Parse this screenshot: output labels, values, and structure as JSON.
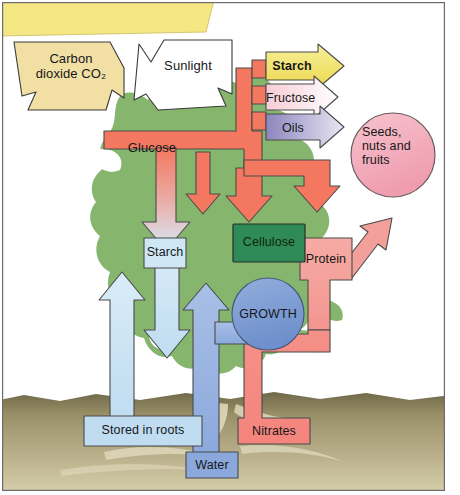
{
  "diagram": {
    "frame": {
      "border_color": "#6b6b6b"
    }
  },
  "palette": {
    "banner_yellow": "#f4e784",
    "co2_tan": "#f2dfa3",
    "sunlight_white": "#ffffff",
    "glucose_salmon": "#f4785f",
    "starch_yellow": "#f2e06a",
    "fructose_pink": "#f4b8c4",
    "oils_purple": "#9a93c4",
    "seeds_pink": "#f3aebc",
    "cellulose_green": "#2e8b57",
    "protein_salmon": "#f4a09a",
    "nitrates_salmon": "#f4847c",
    "growth_blue": "#7b9bd4",
    "water_blue": "#8aa8dc",
    "stored_blue": "#bfdcf0",
    "starch_box_blue": "#cfe6f5",
    "foliage_green": "#86b66e",
    "soil_dark": "#7d7452",
    "soil_light": "#cfc5a0",
    "outline": "#3a3a3a"
  },
  "nodes": {
    "carbon_dioxide": {
      "label": "Carbon\ndioxide CO₂",
      "shape": "down-chevron-arrow",
      "color": "#f2dfa3"
    },
    "sunlight": {
      "label": "Sunlight",
      "shape": "down-chevron-arrow",
      "color": "#ffffff"
    },
    "glucose": {
      "label": "Glucose",
      "shape": "box",
      "color": "#f4785f"
    },
    "starch_top": {
      "label": "Starch",
      "shape": "right-arrow",
      "color": "#f2e06a"
    },
    "fructose": {
      "label": "Fructose",
      "shape": "right-arrow",
      "color": "#f4b8c4"
    },
    "oils": {
      "label": "Oils",
      "shape": "right-arrow",
      "color": "#9a93c4"
    },
    "seeds": {
      "label": "Seeds,\nnuts and\nfruits",
      "shape": "circle",
      "color": "#f3aebc"
    },
    "cellulose": {
      "label": "Cellulose",
      "shape": "box",
      "color": "#2e8b57"
    },
    "protein": {
      "label": "Protein",
      "shape": "box",
      "color": "#f4a09a"
    },
    "growth": {
      "label": "GROWTH",
      "shape": "circle",
      "color": "#7b9bd4"
    },
    "starch_mid": {
      "label": "Starch",
      "shape": "cross-box",
      "color": "#cfe6f5"
    },
    "stored_in_roots": {
      "label": "Stored in roots",
      "shape": "box",
      "color": "#bfdcf0"
    },
    "water": {
      "label": "Water",
      "shape": "box",
      "color": "#8aa8dc"
    },
    "nitrates": {
      "label": "Nitrates",
      "shape": "box",
      "color": "#f4847c"
    }
  },
  "flows": [
    {
      "from": "carbon_dioxide",
      "to": "glucose"
    },
    {
      "from": "sunlight",
      "to": "glucose"
    },
    {
      "from": "glucose",
      "to": "starch_top"
    },
    {
      "from": "glucose",
      "to": "fructose"
    },
    {
      "from": "glucose",
      "to": "oils"
    },
    {
      "from": "starch_top",
      "to": "seeds"
    },
    {
      "from": "fructose",
      "to": "seeds"
    },
    {
      "from": "oils",
      "to": "seeds"
    },
    {
      "from": "glucose",
      "to": "cellulose"
    },
    {
      "from": "glucose",
      "to": "protein"
    },
    {
      "from": "glucose",
      "to": "starch_mid"
    },
    {
      "from": "starch_mid",
      "to": "stored_in_roots"
    },
    {
      "from": "stored_in_roots",
      "to": "starch_mid"
    },
    {
      "from": "protein",
      "to": "seeds"
    },
    {
      "from": "nitrates",
      "to": "protein"
    },
    {
      "from": "water",
      "to": "growth"
    },
    {
      "from": "water",
      "to": "glucose"
    }
  ]
}
